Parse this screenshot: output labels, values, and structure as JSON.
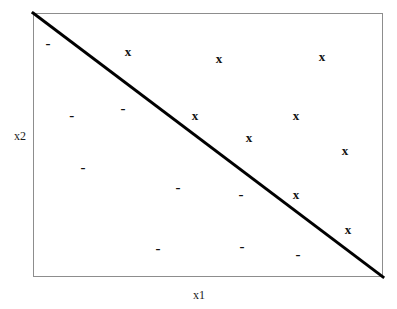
{
  "figure": {
    "title": "",
    "background_color": "#ffffff"
  },
  "axes": {
    "xlabel": "x1",
    "ylabel": "x2",
    "frame_color": "#8d8d8d"
  },
  "boundary": {
    "color": "#000000",
    "width_px": 3,
    "description": "linear decision boundary"
  },
  "chart_data": {
    "type": "scatter",
    "title": "",
    "xlabel": "x1",
    "ylabel": "x2",
    "xlim": [
      0,
      1
    ],
    "ylim": [
      0,
      1
    ],
    "grid": false,
    "legend": null,
    "series": [
      {
        "name": "x",
        "marker": "X",
        "color": "#111111",
        "points": [
          {
            "x": 0.271,
            "y": 0.856,
            "label": "x"
          },
          {
            "x": 0.531,
            "y": 0.83,
            "label": "x"
          },
          {
            "x": 0.826,
            "y": 0.837,
            "label": "x"
          },
          {
            "x": 0.463,
            "y": 0.614,
            "label": "x"
          },
          {
            "x": 0.751,
            "y": 0.614,
            "label": "x"
          },
          {
            "x": 0.617,
            "y": 0.53,
            "label": "x"
          },
          {
            "x": 0.891,
            "y": 0.481,
            "label": "x"
          },
          {
            "x": 0.751,
            "y": 0.314,
            "label": "x"
          },
          {
            "x": 0.9,
            "y": 0.182,
            "label": "x"
          }
        ]
      },
      {
        "name": "-",
        "marker": "-",
        "color": "#111111",
        "points": [
          {
            "x": 0.043,
            "y": 0.886,
            "label": "-"
          },
          {
            "x": 0.257,
            "y": 0.64,
            "label": "-"
          },
          {
            "x": 0.111,
            "y": 0.614,
            "label": "-"
          },
          {
            "x": 0.143,
            "y": 0.417,
            "label": "-"
          },
          {
            "x": 0.414,
            "y": 0.341,
            "label": "-"
          },
          {
            "x": 0.594,
            "y": 0.314,
            "label": "-"
          },
          {
            "x": 0.357,
            "y": 0.11,
            "label": "-"
          },
          {
            "x": 0.597,
            "y": 0.118,
            "label": "-"
          },
          {
            "x": 0.757,
            "y": 0.087,
            "label": "-"
          }
        ]
      }
    ],
    "annotations": [
      {
        "type": "line",
        "name": "decision-boundary",
        "x": [
          0.0,
          1.0
        ],
        "y": [
          1.0,
          0.0
        ],
        "color": "#000000",
        "linewidth": 3
      }
    ]
  }
}
